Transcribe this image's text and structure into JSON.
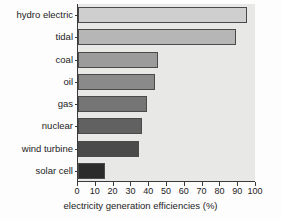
{
  "chart_data": {
    "type": "bar",
    "orientation": "horizontal",
    "title": "",
    "xlabel": "electricity generation efficiencies (%)",
    "ylabel": "",
    "xlim": [
      0,
      100
    ],
    "xticks": [
      0,
      10,
      20,
      30,
      40,
      50,
      60,
      70,
      80,
      90,
      100
    ],
    "xtick_labels": [
      "0",
      "10",
      "20",
      "30",
      "40",
      "50",
      "60",
      "70",
      "80",
      "90",
      "100"
    ],
    "grid": false,
    "legend": null,
    "categories": [
      "hydro electric",
      "tidal",
      "coal",
      "oil",
      "gas",
      "nuclear",
      "wind turbine",
      "solar cell"
    ],
    "values": [
      95,
      89,
      45,
      43,
      39,
      36,
      34,
      15
    ],
    "bar_colors": [
      "#cfcfcf",
      "#b6b6b6",
      "#9b9b9b",
      "#8a8a8a",
      "#757575",
      "#616161",
      "#4a4a4a",
      "#2b2b2b"
    ],
    "bar_edge_color": "#4a4a4a",
    "plot_background": "#e8e8e6",
    "axis_color": "#3a3a3a",
    "series": [
      {
        "name": "electricity generation efficiency",
        "values": [
          95,
          89,
          45,
          43,
          39,
          36,
          34,
          15
        ]
      }
    ]
  }
}
